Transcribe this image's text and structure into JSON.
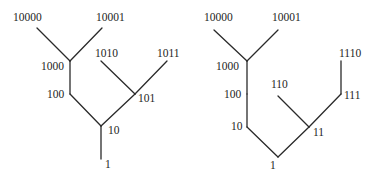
{
  "diagram": {
    "trees": [
      {
        "id": "left-tree",
        "nodes": [
          {
            "id": "1",
            "label": "1",
            "x": 101,
            "y": 159,
            "lx": 105,
            "ly": 168
          },
          {
            "id": "10",
            "label": "10",
            "x": 101,
            "y": 126,
            "lx": 108,
            "ly": 134
          },
          {
            "id": "100",
            "label": "100",
            "x": 70,
            "y": 94,
            "lx": 47,
            "ly": 98
          },
          {
            "id": "101",
            "label": "101",
            "x": 135,
            "y": 94,
            "lx": 138,
            "ly": 102
          },
          {
            "id": "1000",
            "label": "1000",
            "x": 70,
            "y": 61,
            "lx": 41,
            "ly": 70
          },
          {
            "id": "1010",
            "label": "1010",
            "x": 101,
            "y": 61,
            "lx": 95,
            "ly": 57
          },
          {
            "id": "1011",
            "label": "1011",
            "x": 167,
            "y": 61,
            "lx": 157,
            "ly": 57
          },
          {
            "id": "10000",
            "label": "10000",
            "x": 37,
            "y": 28,
            "lx": 13,
            "ly": 21
          },
          {
            "id": "10001",
            "label": "10001",
            "x": 102,
            "y": 28,
            "lx": 96,
            "ly": 21
          }
        ],
        "edges": [
          [
            "1",
            "10"
          ],
          [
            "10",
            "100"
          ],
          [
            "10",
            "101"
          ],
          [
            "100",
            "1000"
          ],
          [
            "1000",
            "10000"
          ],
          [
            "1000",
            "10001"
          ],
          [
            "101",
            "1010"
          ],
          [
            "101",
            "1011"
          ]
        ]
      },
      {
        "id": "right-tree",
        "nodes": [
          {
            "id": "1",
            "label": "1",
            "x": 278,
            "y": 157,
            "lx": 270,
            "ly": 169
          },
          {
            "id": "10",
            "label": "10",
            "x": 247,
            "y": 127,
            "lx": 231,
            "ly": 130
          },
          {
            "id": "11",
            "label": "11",
            "x": 309,
            "y": 127,
            "lx": 313,
            "ly": 136
          },
          {
            "id": "100",
            "label": "100",
            "x": 247,
            "y": 94,
            "lx": 224,
            "ly": 98
          },
          {
            "id": "110",
            "label": "110",
            "x": 278,
            "y": 96,
            "lx": 271,
            "ly": 88
          },
          {
            "id": "111",
            "label": "111",
            "x": 341,
            "y": 94,
            "lx": 344,
            "ly": 99
          },
          {
            "id": "1000",
            "label": "1000",
            "x": 247,
            "y": 61,
            "lx": 216,
            "ly": 70
          },
          {
            "id": "1110",
            "label": "1110",
            "x": 341,
            "y": 61,
            "lx": 339,
            "ly": 57
          },
          {
            "id": "10000",
            "label": "10000",
            "x": 214,
            "y": 30,
            "lx": 204,
            "ly": 21
          },
          {
            "id": "10001",
            "label": "10001",
            "x": 278,
            "y": 30,
            "lx": 272,
            "ly": 21
          }
        ],
        "edges": [
          [
            "1",
            "10"
          ],
          [
            "1",
            "11"
          ],
          [
            "10",
            "100"
          ],
          [
            "100",
            "1000"
          ],
          [
            "1000",
            "10000"
          ],
          [
            "1000",
            "10001"
          ],
          [
            "11",
            "110"
          ],
          [
            "11",
            "111"
          ],
          [
            "111",
            "1110"
          ]
        ]
      }
    ]
  }
}
